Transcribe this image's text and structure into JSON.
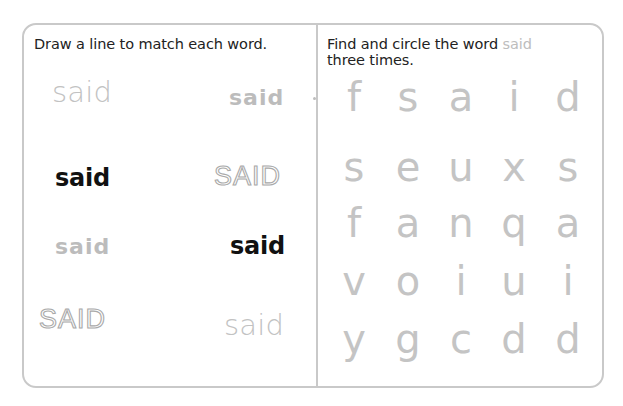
{
  "left_panel": {
    "instruction": "Draw a line to match each word.",
    "words": [
      {
        "text": "said",
        "style": "light",
        "column": "left",
        "row": 0
      },
      {
        "text": "said",
        "style": "school",
        "column": "right",
        "row": 0
      },
      {
        "text": "said",
        "style": "bold",
        "column": "left",
        "row": 1
      },
      {
        "text": "SAID",
        "style": "outline",
        "column": "right",
        "row": 1
      },
      {
        "text": "said",
        "style": "school",
        "column": "left",
        "row": 2
      },
      {
        "text": "said",
        "style": "bold",
        "column": "right",
        "row": 2
      },
      {
        "text": "SAID",
        "style": "outline",
        "column": "left",
        "row": 3
      },
      {
        "text": "said",
        "style": "light",
        "column": "right",
        "row": 3
      }
    ]
  },
  "right_panel": {
    "instruction_prefix": "Find and circle the word ",
    "instruction_word": "said",
    "instruction_suffix": "three times.",
    "grid": [
      [
        "f",
        "s",
        "a",
        "i",
        "d"
      ],
      [
        "s",
        "e",
        "u",
        "x",
        "s"
      ],
      [
        "f",
        "a",
        "n",
        "q",
        "a"
      ],
      [
        "v",
        "o",
        "i",
        "u",
        "i"
      ],
      [
        "y",
        "g",
        "c",
        "d",
        "d"
      ]
    ]
  },
  "colors": {
    "border": "#c9c9c9",
    "instruction_text": "#222222",
    "highlight_word": "#bdbdbd",
    "grid_letters": "#c4c4c4",
    "bold_word": "#111111",
    "light_word": "#c2c2c2",
    "outline_stroke": "#a9a9a9"
  }
}
